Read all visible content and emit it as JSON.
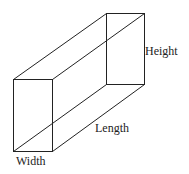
{
  "diagram": {
    "labels": {
      "height": "Height",
      "length": "Length",
      "width": "Width"
    },
    "edges": [
      "front-face",
      "back-face",
      "top-left-depth-edge",
      "top-right-depth-edge",
      "bottom-left-depth-edge",
      "bottom-right-depth-edge"
    ],
    "colors": {
      "line": "#222222",
      "text": "#222222",
      "background": "#ffffff"
    }
  }
}
